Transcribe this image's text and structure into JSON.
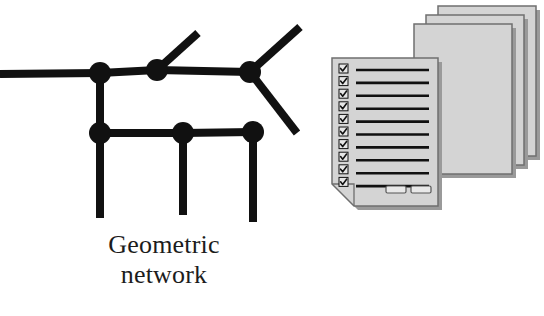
{
  "figure": {
    "background_color": "#ffffff",
    "ink_color": "#111111",
    "paper_fill": "#d4d4d4",
    "paper_edge": "#6f6f6f",
    "paper_shadow": "#9a9a9a"
  },
  "panels": [
    {
      "id": "geometric",
      "caption": "Geometric\nnetwork",
      "caption_lines": [
        "Geometric",
        "network"
      ]
    },
    {
      "id": "logical",
      "caption": "Logical\nnetwork",
      "caption_lines": [
        "Logical",
        "network"
      ]
    }
  ],
  "geometric_network": {
    "line_width": 8,
    "node_radius": 11,
    "nodes": [
      {
        "name": "node-junction-west",
        "x": 100,
        "y": 73
      },
      {
        "name": "node-tee-upper-mid",
        "x": 157,
        "y": 70
      },
      {
        "name": "node-fork-east",
        "x": 250,
        "y": 72
      },
      {
        "name": "node-junction-lower-west",
        "x": 100,
        "y": 133
      },
      {
        "name": "node-tee-lower-mid",
        "x": 183,
        "y": 133
      },
      {
        "name": "node-endpoint-lower-east",
        "x": 253,
        "y": 132
      }
    ],
    "edges": [
      {
        "name": "edge-main-west",
        "x1": 0,
        "y1": 74,
        "x2": 100,
        "y2": 73
      },
      {
        "name": "edge-main-center",
        "x1": 100,
        "y1": 73,
        "x2": 157,
        "y2": 70
      },
      {
        "name": "edge-main-east",
        "x1": 157,
        "y1": 70,
        "x2": 250,
        "y2": 72
      },
      {
        "name": "edge-branch-upper-mid",
        "x1": 157,
        "y1": 70,
        "x2": 198,
        "y2": 33
      },
      {
        "name": "edge-fork-northeast",
        "x1": 250,
        "y1": 72,
        "x2": 300,
        "y2": 27
      },
      {
        "name": "edge-fork-southeast",
        "x1": 250,
        "y1": 72,
        "x2": 297,
        "y2": 133
      },
      {
        "name": "edge-riser-west",
        "x1": 100,
        "y1": 73,
        "x2": 100,
        "y2": 133
      },
      {
        "name": "edge-lower-left",
        "x1": 100,
        "y1": 133,
        "x2": 183,
        "y2": 133
      },
      {
        "name": "edge-lower-right",
        "x1": 183,
        "y1": 133,
        "x2": 253,
        "y2": 132
      },
      {
        "name": "edge-stub-west",
        "x1": 100,
        "y1": 133,
        "x2": 100,
        "y2": 218
      },
      {
        "name": "edge-stub-mid",
        "x1": 183,
        "y1": 133,
        "x2": 183,
        "y2": 215
      },
      {
        "name": "edge-stub-east",
        "x1": 253,
        "y1": 132,
        "x2": 253,
        "y2": 222
      }
    ]
  },
  "logical_network": {
    "sheet_count": 4,
    "back_sheets": [
      {
        "name": "document-sheet-back-3",
        "x": 120,
        "y": 6,
        "width": 98,
        "height": 150
      },
      {
        "name": "document-sheet-back-2",
        "x": 108,
        "y": 15,
        "width": 98,
        "height": 150
      },
      {
        "name": "document-sheet-back-1",
        "x": 96,
        "y": 24,
        "width": 98,
        "height": 150
      }
    ],
    "front_sheet": {
      "name": "document-sheet-front",
      "x": 14,
      "y": 58,
      "width": 106,
      "height": 148,
      "fold_size": 22
    },
    "checkbox_count": 10,
    "checkbox_glyph": "check-mark",
    "text_line_count": 10,
    "button_count": 2
  }
}
